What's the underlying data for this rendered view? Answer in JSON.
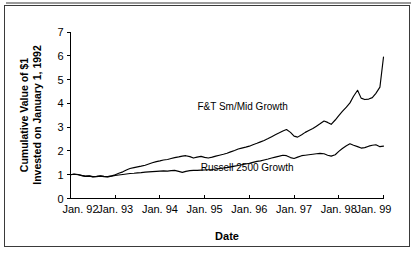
{
  "chart_data": {
    "type": "line",
    "title": "",
    "xlabel": "Date",
    "ylabel": "Cumulative Value of $1 Invested on January 1, 1992",
    "ylabel_line1": "Cumulative Value of $1",
    "ylabel_line2": "Invested on January 1, 1992",
    "ylim": [
      0,
      7
    ],
    "yticks": [
      0,
      1,
      2,
      3,
      4,
      5,
      6,
      7
    ],
    "ytick_labels": [
      "0",
      "1",
      "2",
      "3",
      "4",
      "5",
      "6",
      "7"
    ],
    "xlim": [
      1992.0,
      1999.0
    ],
    "xticks": [
      1992.0,
      1993.0,
      1994.0,
      1995.0,
      1996.0,
      1997.0,
      1998.0,
      1999.0
    ],
    "xtick_labels": [
      "Jan. 92",
      "Jan. 93",
      "Jan. 94",
      "Jan. 95",
      "Jan. 96",
      "Jan. 97",
      "Jan. 98",
      "Jan. 99"
    ],
    "grid": false,
    "legend_position": "inline-annotation",
    "line_color": "#000000",
    "series": [
      {
        "name": "F&T Sm/Mid Growth",
        "annotation_x": 1995.85,
        "annotation_y": 3.72,
        "x": [
          1992.0,
          1992.08,
          1992.17,
          1992.25,
          1992.33,
          1992.42,
          1992.5,
          1992.58,
          1992.67,
          1992.75,
          1992.83,
          1992.92,
          1993.0,
          1993.08,
          1993.17,
          1993.25,
          1993.33,
          1993.42,
          1993.5,
          1993.58,
          1993.67,
          1993.75,
          1993.83,
          1993.92,
          1994.0,
          1994.08,
          1994.17,
          1994.25,
          1994.33,
          1994.42,
          1994.5,
          1994.58,
          1994.67,
          1994.75,
          1994.83,
          1994.92,
          1995.0,
          1995.08,
          1995.17,
          1995.25,
          1995.33,
          1995.42,
          1995.5,
          1995.58,
          1995.67,
          1995.75,
          1995.83,
          1995.92,
          1996.0,
          1996.08,
          1996.17,
          1996.25,
          1996.33,
          1996.42,
          1996.5,
          1996.58,
          1996.67,
          1996.75,
          1996.83,
          1996.92,
          1997.0,
          1997.08,
          1997.17,
          1997.25,
          1997.33,
          1997.42,
          1997.5,
          1997.58,
          1997.67,
          1997.75,
          1997.83,
          1997.92,
          1998.0,
          1998.08,
          1998.17,
          1998.25,
          1998.33,
          1998.42,
          1998.5,
          1998.58,
          1998.67,
          1998.75,
          1998.83,
          1998.92,
          1999.0
        ],
        "values": [
          1.0,
          1.03,
          1.01,
          0.97,
          0.94,
          0.95,
          0.92,
          0.93,
          0.95,
          0.93,
          0.92,
          0.95,
          1.0,
          1.06,
          1.12,
          1.2,
          1.26,
          1.3,
          1.33,
          1.36,
          1.4,
          1.45,
          1.5,
          1.55,
          1.58,
          1.62,
          1.64,
          1.68,
          1.72,
          1.75,
          1.78,
          1.8,
          1.76,
          1.7,
          1.74,
          1.77,
          1.73,
          1.7,
          1.74,
          1.78,
          1.82,
          1.86,
          1.9,
          1.96,
          2.02,
          2.08,
          2.12,
          2.16,
          2.2,
          2.26,
          2.32,
          2.38,
          2.44,
          2.52,
          2.6,
          2.68,
          2.76,
          2.84,
          2.9,
          2.78,
          2.62,
          2.58,
          2.68,
          2.78,
          2.86,
          2.94,
          3.04,
          3.14,
          3.26,
          3.2,
          3.12,
          3.3,
          3.48,
          3.66,
          3.84,
          4.02,
          4.3,
          4.55,
          4.22,
          4.16,
          4.18,
          4.24,
          4.42,
          4.68,
          5.95
        ]
      },
      {
        "name": "Russell 2500 Growth",
        "annotation_x": 1995.95,
        "annotation_y": 1.16,
        "x": [
          1992.0,
          1992.08,
          1992.17,
          1992.25,
          1992.33,
          1992.42,
          1992.5,
          1992.58,
          1992.67,
          1992.75,
          1992.83,
          1992.92,
          1993.0,
          1993.08,
          1993.17,
          1993.25,
          1993.33,
          1993.42,
          1993.5,
          1993.58,
          1993.67,
          1993.75,
          1993.83,
          1993.92,
          1994.0,
          1994.08,
          1994.17,
          1994.25,
          1994.33,
          1994.42,
          1994.5,
          1994.58,
          1994.67,
          1994.75,
          1994.83,
          1994.92,
          1995.0,
          1995.08,
          1995.17,
          1995.25,
          1995.33,
          1995.42,
          1995.5,
          1995.58,
          1995.67,
          1995.75,
          1995.83,
          1995.92,
          1996.0,
          1996.08,
          1996.17,
          1996.25,
          1996.33,
          1996.42,
          1996.5,
          1996.58,
          1996.67,
          1996.75,
          1996.83,
          1996.92,
          1997.0,
          1997.08,
          1997.17,
          1997.25,
          1997.33,
          1997.42,
          1997.5,
          1997.58,
          1997.67,
          1997.75,
          1997.83,
          1997.92,
          1998.0,
          1998.08,
          1998.17,
          1998.25,
          1998.33,
          1998.42,
          1998.5,
          1998.58,
          1998.67,
          1998.75,
          1998.83,
          1998.92,
          1999.0
        ],
        "values": [
          1.0,
          1.02,
          1.0,
          0.96,
          0.93,
          0.94,
          0.91,
          0.92,
          0.94,
          0.92,
          0.91,
          0.94,
          0.97,
          0.99,
          1.01,
          1.03,
          1.05,
          1.06,
          1.08,
          1.09,
          1.11,
          1.12,
          1.13,
          1.14,
          1.15,
          1.16,
          1.15,
          1.17,
          1.18,
          1.14,
          1.1,
          1.14,
          1.17,
          1.18,
          1.18,
          1.19,
          1.2,
          1.21,
          1.22,
          1.24,
          1.26,
          1.28,
          1.3,
          1.33,
          1.36,
          1.39,
          1.42,
          1.45,
          1.48,
          1.52,
          1.56,
          1.58,
          1.62,
          1.66,
          1.7,
          1.74,
          1.78,
          1.82,
          1.8,
          1.72,
          1.68,
          1.74,
          1.8,
          1.82,
          1.84,
          1.86,
          1.88,
          1.9,
          1.88,
          1.82,
          1.78,
          1.84,
          1.98,
          2.1,
          2.22,
          2.3,
          2.24,
          2.18,
          2.12,
          2.14,
          2.2,
          2.24,
          2.26,
          2.18,
          2.2
        ]
      }
    ]
  }
}
